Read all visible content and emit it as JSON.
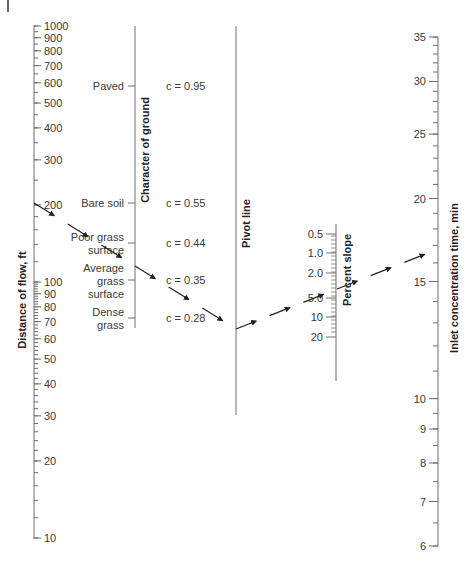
{
  "diagram": {
    "type": "nomograph"
  },
  "axes": {
    "distance": {
      "title": "Distance of flow, ft",
      "labels": [
        "1000",
        "900",
        "800",
        "700",
        "600",
        "500",
        "400",
        "300",
        "200",
        "100",
        "90",
        "80",
        "70",
        "60",
        "50",
        "40",
        "30",
        "20",
        "10"
      ]
    },
    "ground": {
      "title": "Character of ground",
      "categories": [
        {
          "name": "Paved",
          "lines": [
            "Paved"
          ],
          "c": "c = 0.95"
        },
        {
          "name": "Bare soil",
          "lines": [
            "Bare soil"
          ],
          "c": "c = 0.55"
        },
        {
          "name": "Poor grass surface",
          "lines": [
            "Poor grass",
            "surface"
          ],
          "c": "c = 0.44"
        },
        {
          "name": "Average grass surface",
          "lines": [
            "Average",
            "grass",
            "surface"
          ],
          "c": "c = 0.35"
        },
        {
          "name": "Dense grass",
          "lines": [
            "Dense",
            "grass"
          ],
          "c": "c = 0.28"
        }
      ]
    },
    "pivot": {
      "title": "Pivot line"
    },
    "slope": {
      "title": "Percent slope",
      "labels": [
        "0.5",
        "1.0",
        "2.0",
        "5.0",
        "10",
        "20"
      ]
    },
    "time": {
      "title": "Inlet concentration time, min",
      "labels": [
        "35",
        "30",
        "25",
        "20",
        "15",
        "10",
        "9",
        "8",
        "7",
        "6"
      ]
    }
  },
  "example_path": {
    "distance_ft": "200",
    "ground": "Average grass surface",
    "slope_percent": "4",
    "time_min": "15"
  },
  "colors": {
    "line": "#6e6e6e",
    "text": "#3a3a3a",
    "arrow": "#222222"
  }
}
